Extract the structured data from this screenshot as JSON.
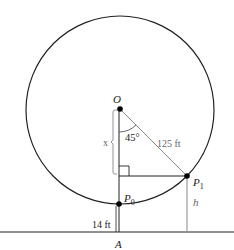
{
  "diagram": {
    "labels": {
      "center": "O",
      "angle": "45°",
      "radius": "125 ft",
      "vertical_segment": "x",
      "point_top": "P",
      "point_top_sub": "1",
      "point_bottom": "P",
      "point_bottom_sub": "0",
      "height": "h",
      "ground_height": "14 ft",
      "base_point": "A"
    },
    "colors": {
      "stroke": "#222222",
      "radius_line": "#777777",
      "label_gray": "#666666"
    }
  }
}
